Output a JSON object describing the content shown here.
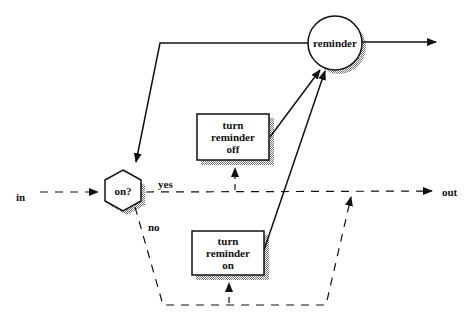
{
  "diagram": {
    "nodes": {
      "reminder": "reminder",
      "decision": "on?",
      "turn_off": [
        "turn",
        "reminder",
        "off"
      ],
      "turn_on": [
        "turn",
        "reminder",
        "on"
      ]
    },
    "labels": {
      "in": "in",
      "out": "out",
      "yes": "yes",
      "no": "no"
    },
    "colors": {
      "line": "#111111",
      "shadow": "#9a9a9a",
      "background": "#ffffff"
    }
  }
}
